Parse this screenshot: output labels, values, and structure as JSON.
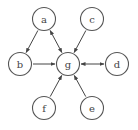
{
  "diagram": {
    "node_radius": 11.5,
    "stroke_color": "#555555",
    "nodes": [
      {
        "id": "a",
        "label": "a",
        "x": 44,
        "y": 19
      },
      {
        "id": "c",
        "label": "c",
        "x": 92,
        "y": 19
      },
      {
        "id": "b",
        "label": "b",
        "x": 20,
        "y": 64
      },
      {
        "id": "g",
        "label": "g",
        "x": 68,
        "y": 64
      },
      {
        "id": "d",
        "label": "d",
        "x": 117,
        "y": 64
      },
      {
        "id": "f",
        "label": "f",
        "x": 44,
        "y": 108
      },
      {
        "id": "e",
        "label": "e",
        "x": 92,
        "y": 108
      }
    ],
    "edges": [
      {
        "from": "a",
        "to": "b",
        "directed": true,
        "bidirectional": false
      },
      {
        "from": "a",
        "to": "g",
        "directed": true,
        "bidirectional": true
      },
      {
        "from": "c",
        "to": "g",
        "directed": true,
        "bidirectional": false
      },
      {
        "from": "b",
        "to": "g",
        "directed": true,
        "bidirectional": false
      },
      {
        "from": "g",
        "to": "d",
        "directed": true,
        "bidirectional": true
      },
      {
        "from": "f",
        "to": "g",
        "directed": true,
        "bidirectional": false
      },
      {
        "from": "e",
        "to": "g",
        "directed": true,
        "bidirectional": false
      }
    ]
  }
}
